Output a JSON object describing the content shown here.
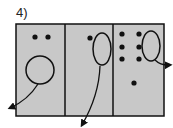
{
  "figure": {
    "label": "4)",
    "colors": {
      "panel_fill": "#c8c8c8",
      "stroke": "#111111",
      "background": "#ffffff"
    },
    "panels": [
      {
        "id": "panel-1",
        "dots": [
          [
            35,
            37
          ],
          [
            48,
            37
          ]
        ],
        "shape": {
          "type": "circle",
          "cx": 40,
          "cy": 70,
          "r": 14
        },
        "arrow": {
          "from": [
            38,
            84
          ],
          "to": [
            10,
            108
          ],
          "direction": "down-left"
        }
      },
      {
        "id": "panel-2",
        "dots": [
          [
            90,
            38
          ]
        ],
        "shape": {
          "type": "ellipse",
          "cx": 102,
          "cy": 49,
          "rx": 9,
          "ry": 16
        },
        "arrow": {
          "from": [
            100,
            66
          ],
          "to": [
            82,
            125
          ],
          "direction": "down"
        }
      },
      {
        "id": "panel-3",
        "dots": [
          [
            122,
            34
          ],
          [
            139,
            34
          ],
          [
            122,
            47
          ],
          [
            139,
            47
          ],
          [
            122,
            59
          ],
          [
            139,
            59
          ],
          [
            134,
            83
          ]
        ],
        "shape": {
          "type": "ellipse",
          "cx": 151,
          "cy": 46,
          "rx": 9,
          "ry": 15
        },
        "arrow": {
          "from": [
            155,
            60
          ],
          "to": [
            170,
            65
          ],
          "direction": "right"
        }
      }
    ]
  }
}
